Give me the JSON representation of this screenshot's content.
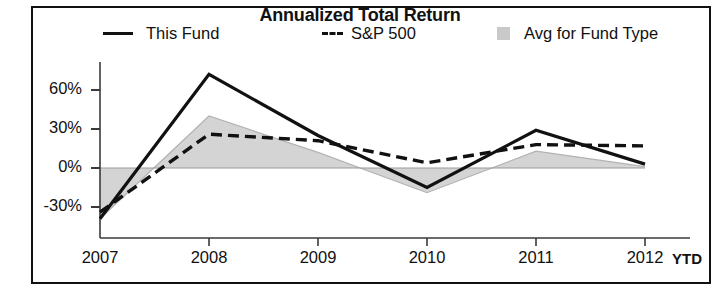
{
  "chart_data": {
    "type": "line",
    "title": "Annualized Total Return",
    "xlabel": "",
    "ylabel": "",
    "categories": [
      "2007",
      "2008",
      "2009",
      "2010",
      "2011",
      "2012"
    ],
    "x_axis_note": "YTD",
    "ylim": [
      -40,
      75
    ],
    "ytick_labels": [
      "60%",
      "30%",
      "0%",
      "-30%"
    ],
    "ytick_values": [
      60,
      30,
      0,
      -30
    ],
    "grid": false,
    "legend_position": "top",
    "series": [
      {
        "name": "This Fund",
        "style": "solid",
        "color": "#111111",
        "values": [
          -39,
          72,
          25,
          -15,
          29,
          3
        ]
      },
      {
        "name": "S&P 500",
        "style": "dashed",
        "color": "#111111",
        "values": [
          -34,
          26,
          21,
          4,
          18,
          17
        ]
      },
      {
        "name": "Avg for Fund Type",
        "style": "area",
        "color": "#d4d4d4",
        "values": [
          -39,
          40,
          12,
          -19,
          13,
          1
        ]
      }
    ]
  },
  "title": {
    "text": "Annualized Total Return"
  },
  "legend": {
    "items": [
      {
        "label": "This Fund",
        "marker": "solid-line-swatch"
      },
      {
        "label": "S&P 500",
        "marker": "dashed-line-swatch"
      },
      {
        "label": "Avg for Fund Type",
        "marker": "gray-square-swatch"
      }
    ]
  },
  "yaxis": {
    "ticks": [
      "60%",
      "30%",
      "0%",
      "-30%"
    ]
  },
  "xaxis": {
    "ticks": [
      "2007",
      "2008",
      "2009",
      "2010",
      "2011",
      "2012"
    ],
    "note": "YTD"
  }
}
